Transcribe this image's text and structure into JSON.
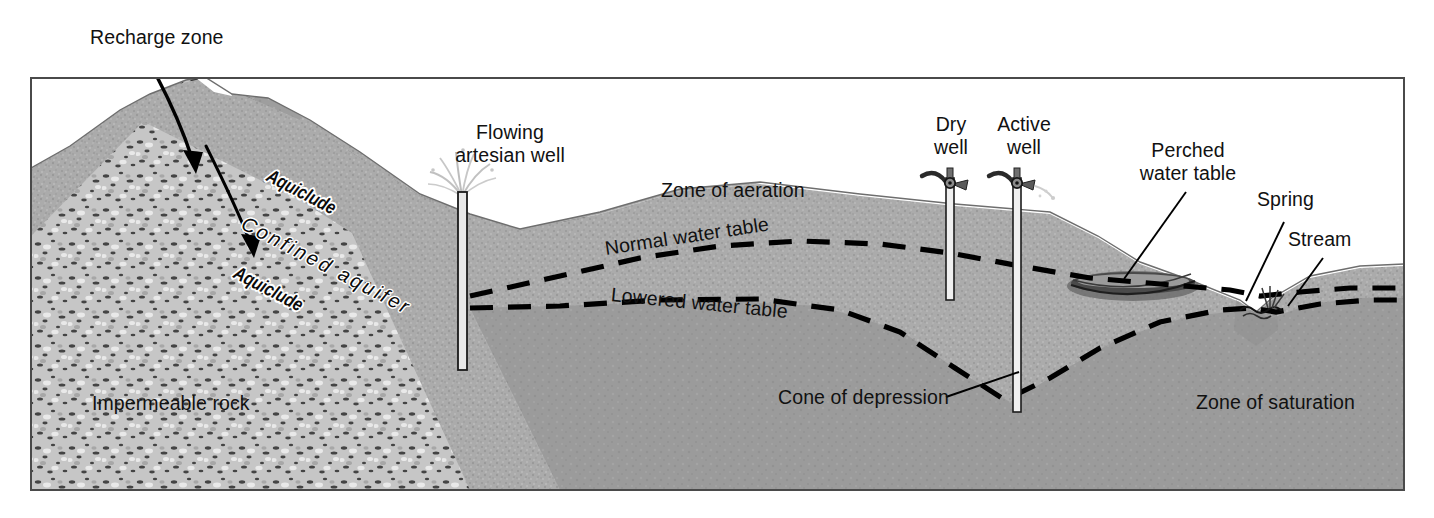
{
  "figure": {
    "kind": "geological-cross-section",
    "frame": {
      "x": 31,
      "y": 78,
      "width": 1373,
      "height": 412,
      "border_color": "#4a4a4a"
    },
    "palette": {
      "background": "#ffffff",
      "aeration_sand": "#a8a8a8",
      "saturation_rock": "#9a9a9a",
      "confined_aquifer": "#9d9d9d",
      "aquiclude_band": "#5a5a5a",
      "impermeable_rock": "#c2c2c2",
      "label_text": "#111111",
      "line_black": "#000000"
    }
  },
  "labels": {
    "recharge_zone": "Recharge zone",
    "flowing_artesian_well": "Flowing\nartesian well",
    "aquiclude_upper": "Aquiclude",
    "aquiclude_lower": "Aquiclude",
    "confined_aquifer": "Confined aquifer",
    "impermeable_rock": "Impermeable rock",
    "zone_of_aeration": "Zone of aeration",
    "normal_water_table": "Normal water table",
    "lowered_water_table": "Lowered water table",
    "cone_of_depression": "Cone of depression",
    "dry_well": "Dry\nwell",
    "active_well": "Active\nwell",
    "perched_water_table": "Perched\nwater table",
    "spring": "Spring",
    "stream": "Stream",
    "zone_of_saturation": "Zone of saturation"
  },
  "annotations": {
    "recharge_arrows": [
      {
        "name": "recharge-arrow-outer",
        "from": [
          146,
          56
        ],
        "to": [
          196,
          170
        ]
      },
      {
        "name": "recharge-arrow-inner",
        "from": [
          206,
          145
        ],
        "to": [
          253,
          253
        ]
      }
    ],
    "leader_lines": [
      {
        "name": "leader-cone-of-depression",
        "from": [
          945,
          395
        ],
        "to": [
          1018,
          372
        ]
      },
      {
        "name": "leader-perched-water-table",
        "from": [
          1185,
          192
        ],
        "to": [
          1123,
          278
        ]
      },
      {
        "name": "leader-spring",
        "from": [
          1283,
          222
        ],
        "to": [
          1245,
          300
        ]
      },
      {
        "name": "leader-stream",
        "from": [
          1322,
          258
        ],
        "to": [
          1287,
          306
        ]
      }
    ]
  },
  "features": {
    "artesian_well": {
      "name": "flowing-artesian-well",
      "pipe_x": 462,
      "top_y": 188,
      "bottom_y": 368,
      "has_spray": true
    },
    "dry_well": {
      "name": "dry-well",
      "pipe_x": 950,
      "head_y": 170,
      "bottom_y": 300,
      "has_spout": false
    },
    "active_well": {
      "name": "active-well",
      "pipe_x": 1017,
      "head_y": 170,
      "bottom_y": 412,
      "has_spout": true
    },
    "perched_lens": {
      "name": "perched-water-table-lens",
      "cx": 1133,
      "cy": 285,
      "rx": 64,
      "ry": 14
    },
    "stream": {
      "name": "stream",
      "x": 1258,
      "y": 308
    }
  },
  "water_tables": {
    "normal": {
      "name": "normal-water-table",
      "style": "dashed",
      "dash": "22 14"
    },
    "lowered": {
      "name": "lowered-water-table",
      "style": "dashed",
      "dash": "22 14"
    }
  }
}
